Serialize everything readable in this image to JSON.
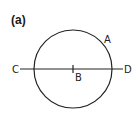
{
  "figure": {
    "panel_label": "(a)",
    "circle": {
      "cx": 73,
      "cy": 69,
      "r": 39,
      "stroke": "#222222"
    },
    "line": {
      "x1": 20,
      "y1": 69,
      "x2": 123,
      "y2": 69
    },
    "tick": {
      "x": 73,
      "y1": 65,
      "y2": 73
    },
    "points": [
      {
        "label": "A",
        "x": 104,
        "y": 43
      },
      {
        "label": "B",
        "x": 75,
        "y": 81
      },
      {
        "label": "C",
        "x": 12,
        "y": 73
      },
      {
        "label": "D",
        "x": 124,
        "y": 73
      }
    ]
  }
}
